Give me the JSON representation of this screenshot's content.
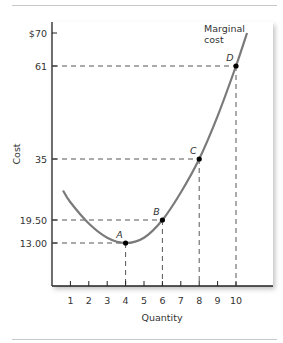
{
  "chart_data": {
    "type": "line",
    "title": "",
    "xlabel": "Quantity",
    "ylabel": "Cost",
    "xlim": [
      0,
      11.5
    ],
    "ylim": [
      0,
      72
    ],
    "x_ticks": [
      "1",
      "2",
      "3",
      "4",
      "5",
      "6",
      "7",
      "8",
      "9",
      "10"
    ],
    "y_ticks": [
      {
        "value": 13.0,
        "label": "13.00"
      },
      {
        "value": 19.5,
        "label": "19.50"
      },
      {
        "value": 35,
        "label": "35"
      },
      {
        "value": 61,
        "label": "61"
      },
      {
        "value": 70,
        "label": "$70"
      }
    ],
    "grid": false,
    "series": [
      {
        "name": "Marginal cost",
        "x": [
          0.6,
          1,
          2,
          3,
          4,
          5,
          6,
          7,
          8,
          9,
          10,
          10.6
        ],
        "y": [
          27,
          24,
          18.5,
          14.5,
          13.0,
          14.5,
          19.5,
          26.5,
          35,
          47,
          61,
          70
        ]
      }
    ],
    "points": [
      {
        "label": "A",
        "x": 4,
        "y": 13.0
      },
      {
        "label": "B",
        "x": 6,
        "y": 19.5
      },
      {
        "label": "C",
        "x": 8,
        "y": 35
      },
      {
        "label": "D",
        "x": 10,
        "y": 61
      }
    ],
    "annotations": [
      "Marginal cost"
    ],
    "legend_position": "none"
  },
  "labels": {
    "x_axis": "Quantity",
    "y_axis": "Cost",
    "curve_line1": "Marginal",
    "curve_line2": "cost"
  }
}
